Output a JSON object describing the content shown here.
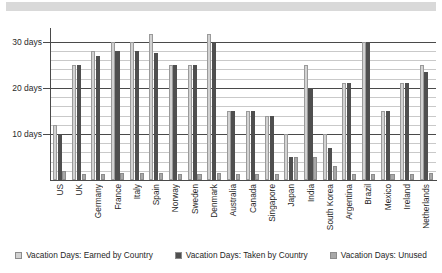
{
  "top_banner": {
    "present": true,
    "color": "#d9d9d9"
  },
  "legend": {
    "position": "bottom-center",
    "items": [
      {
        "label": "Vacation Days: Earned by Country",
        "color": "#d2d2d2",
        "swatch": "legend-swatch-earned"
      },
      {
        "label": "Vacation Days: Taken by Country",
        "color": "#4f4f4f",
        "swatch": "legend-swatch-taken"
      },
      {
        "label": "Vacation Days: Unused",
        "color": "#a8a8a8",
        "swatch": "legend-swatch-unused"
      }
    ]
  },
  "axis": {
    "y_ticks": [
      {
        "label": "30 days",
        "value": 30
      },
      {
        "label": "20 days",
        "value": 20
      },
      {
        "label": "10 days",
        "value": 10
      }
    ]
  },
  "chart_data": {
    "type": "bar",
    "title": "",
    "subtitle": "",
    "xlabel": "",
    "ylabel": "",
    "ylim": [
      0,
      31.7
    ],
    "grid": true,
    "grid_step": 2,
    "legend_position": "bottom-center",
    "categories": [
      "US",
      "UK",
      "Germany",
      "France",
      "Italy",
      "Spain",
      "Norway",
      "Sweden",
      "Denmark",
      "Australia",
      "Canada",
      "Singapore",
      "Japan",
      "India",
      "South Korea",
      "Argentina",
      "Brazil",
      "Mexico",
      "Ireland",
      "Netherlands"
    ],
    "series": [
      {
        "name": "Vacation Days: Earned by Country",
        "color": "#d2d2d2",
        "values": [
          12,
          25,
          28,
          30,
          30,
          31.7,
          25,
          25,
          31.7,
          15,
          15,
          14,
          10,
          25,
          10,
          21,
          30,
          15,
          21,
          25
        ]
      },
      {
        "name": "Vacation Days: Taken by Country",
        "color": "#4f4f4f",
        "values": [
          10,
          25,
          27,
          28,
          28,
          27.5,
          25,
          25,
          30,
          15,
          15,
          14,
          5,
          20,
          7,
          21,
          30,
          15,
          21,
          23.5
        ]
      },
      {
        "name": "Vacation Days: Unused",
        "color": "#a8a8a8",
        "values": [
          2,
          1.2,
          1.2,
          1.5,
          1.5,
          1.5,
          1.2,
          1.2,
          1.5,
          1.2,
          1.2,
          1.2,
          5,
          5,
          3,
          1.2,
          1.2,
          1.2,
          1.2,
          1.5
        ]
      }
    ]
  }
}
